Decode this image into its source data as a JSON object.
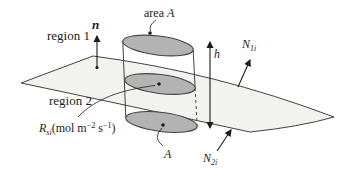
{
  "figure": {
    "title_hint": "interface-flux-pillbox-diagram",
    "labels": {
      "region1": "region 1",
      "region2": "region 2",
      "normal_vector": "n",
      "area_top_prefix": "area ",
      "area_top_var": "A",
      "area_bottom_var": "A",
      "height_var": "h",
      "flux_region1": {
        "base": "N",
        "sub": "1i"
      },
      "flux_region2": {
        "base": "N",
        "sub": "2i"
      },
      "surface_rate": {
        "base": "R",
        "sub": "si",
        "unit_part1": "(mol m",
        "unit_exp1": "−2",
        "unit_part2": " s",
        "unit_exp2": "−1",
        "unit_part3": ")"
      }
    },
    "colors": {
      "sheet": "#f2f2ef",
      "disk": "#b3b3b3",
      "stroke": "#424242",
      "text": "#1c1c1c"
    }
  }
}
